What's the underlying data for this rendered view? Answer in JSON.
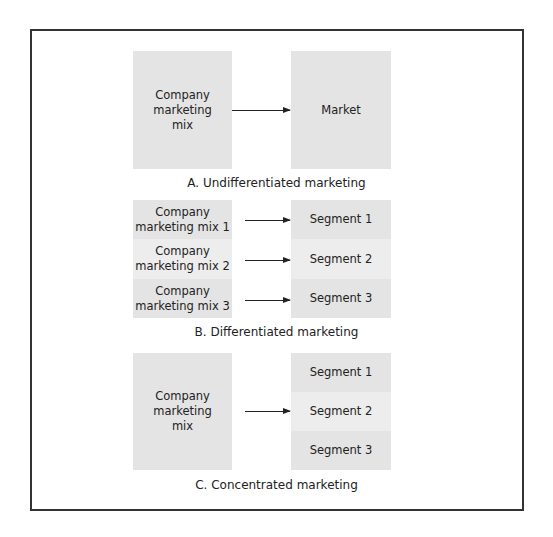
{
  "panels": {
    "a": {
      "caption": "A. Undifferentiated marketing",
      "source": [
        "Company",
        "marketing",
        "mix"
      ],
      "target": "Market"
    },
    "b": {
      "caption": "B. Differentiated marketing",
      "rows": [
        {
          "source_line1": "Company",
          "source_line2": "marketing mix 1",
          "target": "Segment 1"
        },
        {
          "source_line1": "Company",
          "source_line2": "marketing mix 2",
          "target": "Segment 2"
        },
        {
          "source_line1": "Company",
          "source_line2": "marketing mix 3",
          "target": "Segment 3"
        }
      ]
    },
    "c": {
      "caption": "C. Concentrated marketing",
      "source": [
        "Company",
        "marketing",
        "mix"
      ],
      "segments": [
        "Segment 1",
        "Segment 2",
        "Segment 3"
      ]
    }
  },
  "colors": {
    "box_fill": "#e4e4e4",
    "frame": "#333333",
    "arrow": "#222222"
  }
}
